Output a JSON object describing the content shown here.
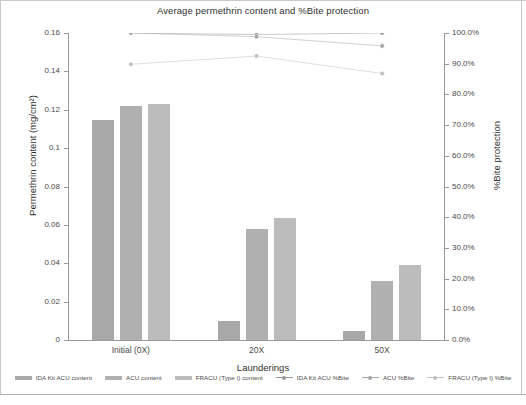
{
  "chart_data": {
    "type": "bar",
    "title": "Average permethrin content and %Bite protection",
    "xlabel": "Launderings",
    "ylabel": "Permethrin content (mg/cm²)",
    "ylabel_secondary": "%Bite protection",
    "categories": [
      "Initial (0X)",
      "20X",
      "50X"
    ],
    "ylim": [
      0,
      0.16
    ],
    "ylim_secondary": [
      0,
      1.0
    ],
    "grid": false,
    "legend_position": "bottom",
    "yticks": [
      "0",
      "0.02",
      "0.04",
      "0.06",
      "0.08",
      "0.1",
      "0.12",
      "0.14",
      "0.16"
    ],
    "ytick_values": [
      0,
      0.02,
      0.04,
      0.06,
      0.08,
      0.1,
      0.12,
      0.14,
      0.16
    ],
    "yticks_secondary": [
      "0.0%",
      "10.0%",
      "20.0%",
      "30.0%",
      "40.0%",
      "50.0%",
      "60.0%",
      "70.0%",
      "80.0%",
      "90.0%",
      "100.0%"
    ],
    "ytick_values_secondary": [
      0,
      0.1,
      0.2,
      0.3,
      0.4,
      0.5,
      0.6,
      0.7,
      0.8,
      0.9,
      1.0
    ],
    "series": [
      {
        "name": "IDA Kit ACU content",
        "kind": "bar",
        "axis": "left",
        "color": "#a8a8a8",
        "values": [
          0.1148,
          0.0098,
          0.0045
        ]
      },
      {
        "name": "ACU content",
        "kind": "bar",
        "axis": "left",
        "color": "#b0b0b0",
        "values": [
          0.1218,
          0.0578,
          0.0305
        ]
      },
      {
        "name": "FRACU (Type I) content",
        "kind": "bar",
        "axis": "left",
        "color": "#bcbcbc",
        "values": [
          0.1228,
          0.0635,
          0.0392
        ]
      },
      {
        "name": "IDA Kit ACU %Bite",
        "kind": "marker",
        "axis": "right",
        "color": "#9a9a9a",
        "values": [
          1.0,
          0.995,
          1.0
        ]
      },
      {
        "name": "ACU %Bite",
        "kind": "marker",
        "axis": "right",
        "color": "#a6a6a6",
        "values": [
          1.0,
          0.988,
          0.958
        ]
      },
      {
        "name": "FRACU (Type I) %Bite",
        "kind": "marker",
        "axis": "right",
        "color": "#c0c0c0",
        "values": [
          0.898,
          0.925,
          0.868
        ]
      }
    ]
  },
  "legend": {
    "items": [
      {
        "label": "IDA Kit ACU content",
        "type": "bar",
        "color": "#a8a8a8"
      },
      {
        "label": "ACU content",
        "type": "bar",
        "color": "#b0b0b0"
      },
      {
        "label": "FRACU (Type I) content",
        "type": "bar",
        "color": "#bcbcbc"
      },
      {
        "label": "IDA Kit ACU %Bite",
        "type": "marker",
        "color": "#9a9a9a"
      },
      {
        "label": "ACU %Bite",
        "type": "marker",
        "color": "#a6a6a6"
      },
      {
        "label": "FRACU (Type I) %Bite",
        "type": "marker",
        "color": "#c0c0c0"
      }
    ]
  }
}
